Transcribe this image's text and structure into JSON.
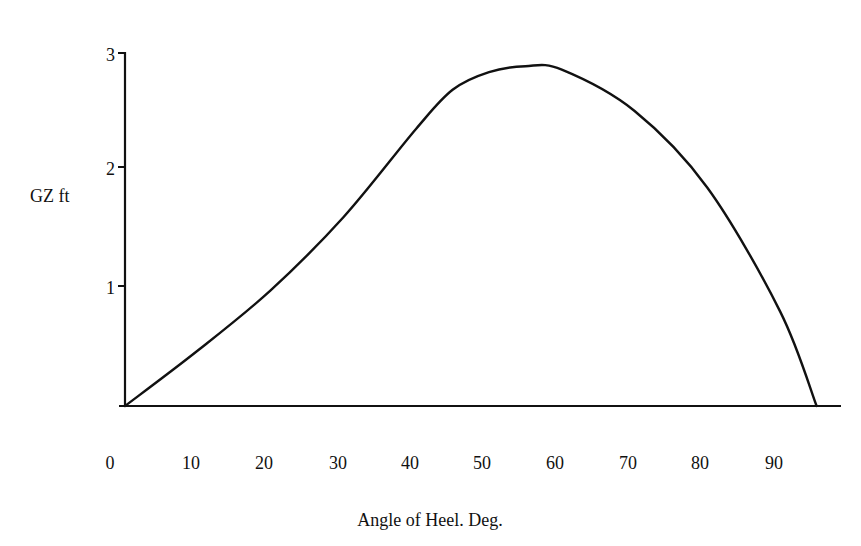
{
  "chart_data": {
    "type": "line",
    "title": "",
    "xlabel": "Angle of Heel. Deg.",
    "ylabel": "GZ ft",
    "x_ticks": [
      "0",
      "10",
      "20",
      "30",
      "40",
      "50",
      "60",
      "70",
      "80",
      "90"
    ],
    "y_ticks": [
      "1",
      "2",
      "3"
    ],
    "xlim": [
      0,
      100
    ],
    "ylim": [
      0,
      3
    ],
    "grid": false,
    "legend": null,
    "series": [
      {
        "name": "GZ curve",
        "x": [
          0,
          10,
          20,
          30,
          40,
          45,
          50,
          55,
          60,
          70,
          80,
          90,
          95
        ],
        "values": [
          0,
          0.47,
          0.98,
          1.6,
          2.35,
          2.68,
          2.83,
          2.88,
          2.85,
          2.5,
          1.85,
          0.8,
          0
        ]
      }
    ]
  },
  "axes": {
    "ylabel": "GZ ft",
    "xlabel": "Angle of Heel. Deg.",
    "y_tick_labels": {
      "t1": "1",
      "t2": "2",
      "t3": "3"
    },
    "x_tick_labels": [
      "0",
      "10",
      "20",
      "30",
      "40",
      "50",
      "60",
      "70",
      "80",
      "90"
    ]
  },
  "style": {
    "line_color": "#111111",
    "axis_color": "#111111",
    "background": "#ffffff"
  }
}
